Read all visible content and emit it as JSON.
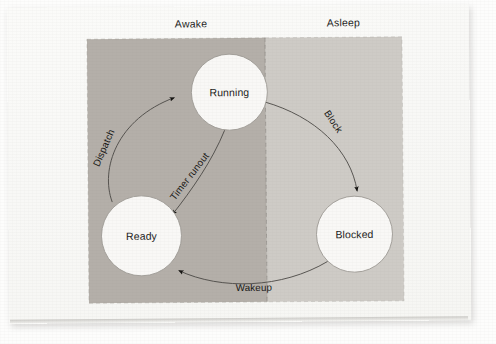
{
  "figure": {
    "background_color": "#fdfdfc",
    "paper_color": "#faf9f7"
  },
  "zones": [
    {
      "id": "awake",
      "label": "Awake",
      "fill": "#b4afa9",
      "label_x": 186,
      "label_y": 24,
      "rect": {
        "x": 88,
        "y": 38,
        "width": 178,
        "height": 264
      }
    },
    {
      "id": "asleep",
      "label": "Asleep",
      "fill": "#cecbc6",
      "label_x": 337,
      "label_y": 24,
      "rect": {
        "x": 266,
        "y": 38,
        "width": 137,
        "height": 264
      }
    }
  ],
  "divider": {
    "name": "zone-divider",
    "x": 266,
    "y1": 38,
    "y2": 302,
    "dash": "4 3",
    "color": "#8e8a85"
  },
  "states": [
    {
      "id": "running",
      "label": "Running",
      "cx": 230,
      "cy": 92,
      "r": 38,
      "fill": "#f9f8f6",
      "stroke": "#9d9a95"
    },
    {
      "id": "ready",
      "label": "Ready",
      "cx": 141,
      "cy": 235,
      "r": 40,
      "fill": "#f9f8f6",
      "stroke": "#9d9a95"
    },
    {
      "id": "blocked",
      "label": "Blocked",
      "cx": 354,
      "cy": 235,
      "r": 38,
      "fill": "#f9f8f6",
      "stroke": "#9d9a95"
    }
  ],
  "transitions": [
    {
      "id": "dispatch",
      "label": "Dispatch",
      "from": "ready",
      "to": "running",
      "path": "M 112 201 C 100 168 117 118 175 97",
      "label_x": 107,
      "label_y": 148,
      "label_rotate": -66,
      "arrow_at": "running"
    },
    {
      "id": "timer-runout",
      "label": "Timer runout",
      "from": "running",
      "to": "ready",
      "path": "M 225 130 C 210 160 191 188 169 213",
      "label_x": 190,
      "label_y": 176,
      "label_rotate": -52,
      "arrow_at": "ready"
    },
    {
      "id": "block",
      "label": "Block",
      "from": "running",
      "to": "blocked",
      "path": "M 265 102 C 315 116 350 150 357 192",
      "label_x": 330,
      "label_y": 124,
      "label_rotate": 57,
      "arrow_at": "blocked"
    },
    {
      "id": "wakeup",
      "label": "Wakeup",
      "from": "blocked",
      "to": "ready",
      "path": "M 327 262 C 280 288 220 289 176 269",
      "label_x": 253,
      "label_y": 288,
      "label_rotate": 0,
      "arrow_at": "ready"
    }
  ],
  "colors": {
    "zone_awake": "#b4afa9",
    "zone_asleep": "#cecbc6",
    "circle_fill": "#f9f8f6",
    "stroke": "#6f6c67",
    "text": "#1b1b1a"
  }
}
